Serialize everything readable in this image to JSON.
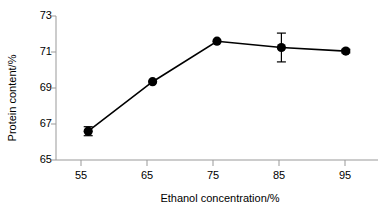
{
  "chart_data": {
    "type": "line",
    "title": "",
    "subtitle": "",
    "xlabel": "Ethanol concentration/%",
    "ylabel": "Protein content/%",
    "x": [
      55,
      65,
      75,
      85,
      95
    ],
    "categories": [
      "55",
      "65",
      "75",
      "85",
      "95"
    ],
    "values": [
      66.6,
      69.35,
      71.6,
      71.25,
      71.05
    ],
    "errors": [
      0.25,
      0.0,
      0.0,
      0.8,
      0.1
    ],
    "series": [
      {
        "name": "Protein content",
        "values": [
          66.6,
          69.35,
          71.6,
          71.25,
          71.05
        ],
        "errors": [
          0.25,
          0.0,
          0.0,
          0.8,
          0.1
        ],
        "marker": "filled-circle",
        "color": "#000000"
      }
    ],
    "xlim": [
      50,
      100
    ],
    "ylim": [
      65,
      73
    ],
    "xticks": [
      55,
      65,
      75,
      85,
      95
    ],
    "yticks": [
      65,
      67,
      69,
      71,
      73
    ],
    "xtick_labels": [
      "55",
      "65",
      "75",
      "85",
      "95"
    ],
    "ytick_labels": [
      "65",
      "67",
      "69",
      "71",
      "73"
    ],
    "grid": false,
    "legend": null,
    "legend_position": "none",
    "line_color": "#000000",
    "marker_color": "#000000",
    "axis_color": "#808080"
  }
}
